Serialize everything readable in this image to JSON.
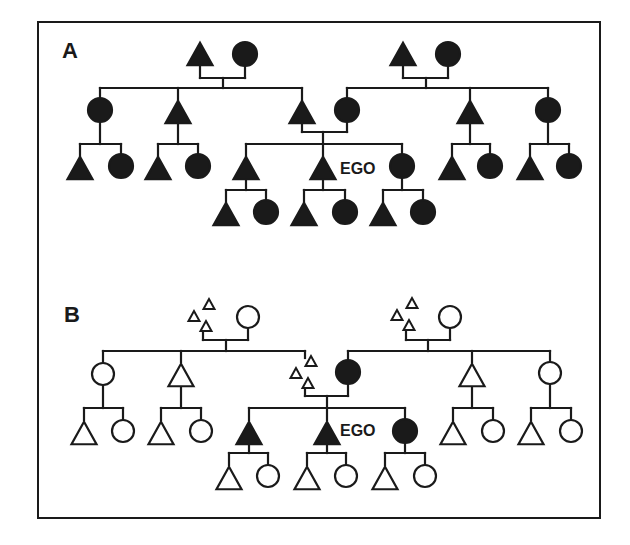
{
  "figure": {
    "ink_color": "#1a1a1a",
    "background": "#ffffff",
    "border": {
      "x": 38,
      "y": 22,
      "width": 562,
      "height": 496
    },
    "panels": [
      {
        "id": "A",
        "label": "A",
        "label_pos": [
          62,
          58
        ],
        "ego_label": "EGO",
        "ego_label_pos": [
          336,
          174
        ],
        "nodes": [
          {
            "id": "gp1m",
            "shape": "triangle",
            "fill": "filled",
            "x": 200,
            "y": 54
          },
          {
            "id": "gp1f",
            "shape": "circle",
            "fill": "filled",
            "x": 245,
            "y": 54
          },
          {
            "id": "gp2m",
            "shape": "triangle",
            "fill": "filled",
            "x": 403,
            "y": 54
          },
          {
            "id": "gp2f",
            "shape": "circle",
            "fill": "filled",
            "x": 448,
            "y": 54
          },
          {
            "id": "p1",
            "shape": "circle",
            "fill": "filled",
            "x": 100,
            "y": 110
          },
          {
            "id": "p2",
            "shape": "triangle",
            "fill": "filled",
            "x": 178,
            "y": 112
          },
          {
            "id": "father",
            "shape": "triangle",
            "fill": "filled",
            "x": 302,
            "y": 112
          },
          {
            "id": "mother",
            "shape": "circle",
            "fill": "filled",
            "x": 347,
            "y": 110
          },
          {
            "id": "p5",
            "shape": "triangle",
            "fill": "filled",
            "x": 470,
            "y": 112
          },
          {
            "id": "p6",
            "shape": "circle",
            "fill": "filled",
            "x": 548,
            "y": 110
          },
          {
            "id": "c1m",
            "shape": "triangle",
            "fill": "filled",
            "x": 80,
            "y": 168
          },
          {
            "id": "c1f",
            "shape": "circle",
            "fill": "filled",
            "x": 121,
            "y": 166
          },
          {
            "id": "c2m",
            "shape": "triangle",
            "fill": "filled",
            "x": 158,
            "y": 168
          },
          {
            "id": "c2f",
            "shape": "circle",
            "fill": "filled",
            "x": 198,
            "y": 166
          },
          {
            "id": "sib1",
            "shape": "triangle",
            "fill": "filled",
            "x": 246,
            "y": 168
          },
          {
            "id": "ego",
            "shape": "triangle",
            "fill": "filled",
            "x": 323,
            "y": 168
          },
          {
            "id": "sib2",
            "shape": "circle",
            "fill": "filled",
            "x": 402,
            "y": 166
          },
          {
            "id": "c5m",
            "shape": "triangle",
            "fill": "filled",
            "x": 452,
            "y": 168
          },
          {
            "id": "c5f",
            "shape": "circle",
            "fill": "filled",
            "x": 490,
            "y": 166
          },
          {
            "id": "c6m",
            "shape": "triangle",
            "fill": "filled",
            "x": 530,
            "y": 168
          },
          {
            "id": "c6f",
            "shape": "circle",
            "fill": "filled",
            "x": 569,
            "y": 166
          },
          {
            "id": "n1m",
            "shape": "triangle",
            "fill": "filled",
            "x": 226,
            "y": 214
          },
          {
            "id": "n1f",
            "shape": "circle",
            "fill": "filled",
            "x": 266,
            "y": 212
          },
          {
            "id": "n2m",
            "shape": "triangle",
            "fill": "filled",
            "x": 304,
            "y": 214
          },
          {
            "id": "n2f",
            "shape": "circle",
            "fill": "filled",
            "x": 345,
            "y": 212
          },
          {
            "id": "n3m",
            "shape": "triangle",
            "fill": "filled",
            "x": 383,
            "y": 214
          },
          {
            "id": "n3f",
            "shape": "circle",
            "fill": "filled",
            "x": 423,
            "y": 212
          }
        ],
        "lines": [
          [
            200,
            66,
            200,
            78
          ],
          [
            245,
            66,
            245,
            78
          ],
          [
            200,
            78,
            245,
            78
          ],
          [
            223,
            78,
            223,
            88
          ],
          [
            100,
            88,
            302,
            88
          ],
          [
            178,
            88,
            178,
            100
          ],
          [
            100,
            88,
            100,
            98
          ],
          [
            302,
            88,
            302,
            100
          ],
          [
            403,
            66,
            403,
            78
          ],
          [
            448,
            66,
            448,
            78
          ],
          [
            403,
            78,
            448,
            78
          ],
          [
            426,
            78,
            426,
            88
          ],
          [
            347,
            88,
            548,
            88
          ],
          [
            347,
            88,
            347,
            98
          ],
          [
            470,
            88,
            470,
            100
          ],
          [
            548,
            88,
            548,
            98
          ],
          [
            100,
            122,
            100,
            144
          ],
          [
            80,
            144,
            121,
            144
          ],
          [
            80,
            144,
            80,
            156
          ],
          [
            121,
            144,
            121,
            154
          ],
          [
            178,
            124,
            178,
            144
          ],
          [
            158,
            144,
            198,
            144
          ],
          [
            158,
            144,
            158,
            156
          ],
          [
            198,
            144,
            198,
            154
          ],
          [
            302,
            124,
            302,
            132
          ],
          [
            347,
            122,
            347,
            132
          ],
          [
            302,
            132,
            347,
            132
          ],
          [
            323,
            132,
            323,
            144
          ],
          [
            246,
            144,
            402,
            144
          ],
          [
            246,
            144,
            246,
            156
          ],
          [
            323,
            144,
            323,
            156
          ],
          [
            402,
            144,
            402,
            154
          ],
          [
            470,
            124,
            470,
            144
          ],
          [
            452,
            144,
            490,
            144
          ],
          [
            452,
            144,
            452,
            156
          ],
          [
            490,
            144,
            490,
            154
          ],
          [
            548,
            122,
            548,
            144
          ],
          [
            530,
            144,
            569,
            144
          ],
          [
            530,
            144,
            530,
            156
          ],
          [
            569,
            144,
            569,
            154
          ],
          [
            246,
            180,
            246,
            190
          ],
          [
            226,
            190,
            266,
            190
          ],
          [
            226,
            190,
            226,
            202
          ],
          [
            266,
            190,
            266,
            200
          ],
          [
            323,
            180,
            323,
            190
          ],
          [
            304,
            190,
            345,
            190
          ],
          [
            304,
            190,
            304,
            202
          ],
          [
            345,
            190,
            345,
            200
          ],
          [
            402,
            178,
            402,
            190
          ],
          [
            383,
            190,
            423,
            190
          ],
          [
            383,
            190,
            383,
            202
          ],
          [
            423,
            190,
            423,
            200
          ]
        ]
      },
      {
        "id": "B",
        "label": "B",
        "label_pos": [
          64,
          322
        ],
        "ego_label": "EGO",
        "ego_label_pos": [
          336,
          436
        ],
        "nodes": [
          {
            "id": "gp1m",
            "shape": "triangle-cluster",
            "fill": "outline",
            "x": 203,
            "y": 316
          },
          {
            "id": "gp1f",
            "shape": "circle",
            "fill": "outline",
            "x": 248,
            "y": 317
          },
          {
            "id": "gp2m",
            "shape": "triangle-cluster",
            "fill": "outline",
            "x": 406,
            "y": 315
          },
          {
            "id": "gp2f",
            "shape": "circle",
            "fill": "outline",
            "x": 450,
            "y": 317
          },
          {
            "id": "p1",
            "shape": "circle",
            "fill": "outline",
            "x": 103,
            "y": 374
          },
          {
            "id": "p2",
            "shape": "triangle",
            "fill": "outline",
            "x": 181,
            "y": 375
          },
          {
            "id": "father",
            "shape": "triangle-cluster",
            "fill": "outline",
            "x": 305,
            "y": 373
          },
          {
            "id": "mother",
            "shape": "circle",
            "fill": "filled",
            "x": 348,
            "y": 372
          },
          {
            "id": "p5",
            "shape": "triangle",
            "fill": "outline",
            "x": 472,
            "y": 375
          },
          {
            "id": "p6",
            "shape": "circle",
            "fill": "outline",
            "x": 550,
            "y": 373
          },
          {
            "id": "c1m",
            "shape": "triangle",
            "fill": "outline",
            "x": 84,
            "y": 433
          },
          {
            "id": "c1f",
            "shape": "circle",
            "fill": "outline",
            "x": 123,
            "y": 431
          },
          {
            "id": "c2m",
            "shape": "triangle",
            "fill": "outline",
            "x": 161,
            "y": 433
          },
          {
            "id": "c2f",
            "shape": "circle",
            "fill": "outline",
            "x": 201,
            "y": 431
          },
          {
            "id": "sib1",
            "shape": "triangle",
            "fill": "filled",
            "x": 249,
            "y": 433
          },
          {
            "id": "ego",
            "shape": "triangle",
            "fill": "filled",
            "x": 327,
            "y": 433
          },
          {
            "id": "sib2",
            "shape": "circle",
            "fill": "filled",
            "x": 405,
            "y": 431
          },
          {
            "id": "c5m",
            "shape": "triangle",
            "fill": "outline",
            "x": 453,
            "y": 433
          },
          {
            "id": "c5f",
            "shape": "circle",
            "fill": "outline",
            "x": 493,
            "y": 431
          },
          {
            "id": "c6m",
            "shape": "triangle",
            "fill": "outline",
            "x": 531,
            "y": 433
          },
          {
            "id": "c6f",
            "shape": "circle",
            "fill": "outline",
            "x": 571,
            "y": 431
          },
          {
            "id": "n1m",
            "shape": "triangle",
            "fill": "outline",
            "x": 229,
            "y": 478
          },
          {
            "id": "n1f",
            "shape": "circle",
            "fill": "outline",
            "x": 268,
            "y": 476
          },
          {
            "id": "n2m",
            "shape": "triangle",
            "fill": "outline",
            "x": 307,
            "y": 478
          },
          {
            "id": "n2f",
            "shape": "circle",
            "fill": "outline",
            "x": 346,
            "y": 476
          },
          {
            "id": "n3m",
            "shape": "triangle",
            "fill": "outline",
            "x": 385,
            "y": 478
          },
          {
            "id": "n3f",
            "shape": "circle",
            "fill": "outline",
            "x": 425,
            "y": 476
          }
        ],
        "lines": [
          [
            203,
            330,
            203,
            340
          ],
          [
            248,
            329,
            248,
            340
          ],
          [
            203,
            340,
            248,
            340
          ],
          [
            226,
            340,
            226,
            351
          ],
          [
            103,
            351,
            305,
            351
          ],
          [
            103,
            351,
            103,
            362
          ],
          [
            181,
            351,
            181,
            362
          ],
          [
            305,
            351,
            305,
            358
          ],
          [
            406,
            329,
            406,
            340
          ],
          [
            450,
            329,
            450,
            340
          ],
          [
            406,
            340,
            450,
            340
          ],
          [
            428,
            340,
            428,
            351
          ],
          [
            348,
            351,
            550,
            351
          ],
          [
            348,
            351,
            348,
            360
          ],
          [
            472,
            351,
            472,
            362
          ],
          [
            550,
            351,
            550,
            361
          ],
          [
            103,
            386,
            103,
            408
          ],
          [
            84,
            408,
            123,
            408
          ],
          [
            84,
            408,
            84,
            420
          ],
          [
            123,
            408,
            123,
            419
          ],
          [
            181,
            387,
            181,
            408
          ],
          [
            161,
            408,
            201,
            408
          ],
          [
            161,
            408,
            161,
            420
          ],
          [
            201,
            408,
            201,
            419
          ],
          [
            305,
            386,
            305,
            396
          ],
          [
            348,
            384,
            348,
            396
          ],
          [
            305,
            396,
            348,
            396
          ],
          [
            327,
            396,
            327,
            408
          ],
          [
            249,
            408,
            405,
            408
          ],
          [
            249,
            408,
            249,
            420
          ],
          [
            327,
            408,
            327,
            420
          ],
          [
            405,
            408,
            405,
            419
          ],
          [
            472,
            387,
            472,
            408
          ],
          [
            453,
            408,
            493,
            408
          ],
          [
            453,
            408,
            453,
            420
          ],
          [
            493,
            408,
            493,
            419
          ],
          [
            550,
            385,
            550,
            408
          ],
          [
            531,
            408,
            571,
            408
          ],
          [
            531,
            408,
            531,
            420
          ],
          [
            571,
            408,
            571,
            419
          ],
          [
            249,
            445,
            249,
            453
          ],
          [
            229,
            453,
            268,
            453
          ],
          [
            229,
            453,
            229,
            465
          ],
          [
            268,
            453,
            268,
            464
          ],
          [
            327,
            445,
            327,
            453
          ],
          [
            307,
            453,
            346,
            453
          ],
          [
            307,
            453,
            307,
            465
          ],
          [
            346,
            453,
            346,
            464
          ],
          [
            405,
            443,
            405,
            453
          ],
          [
            385,
            453,
            425,
            453
          ],
          [
            385,
            453,
            385,
            465
          ],
          [
            425,
            453,
            425,
            464
          ]
        ]
      }
    ]
  }
}
